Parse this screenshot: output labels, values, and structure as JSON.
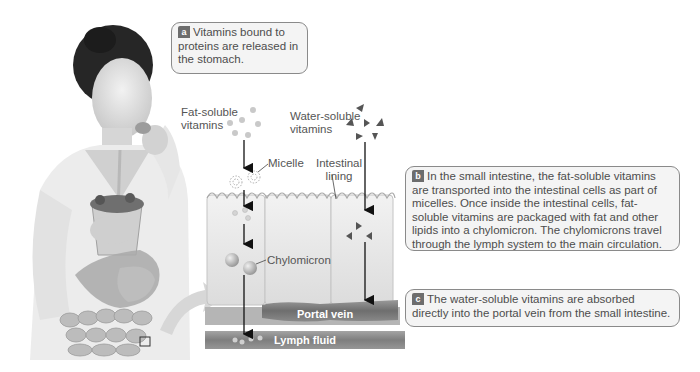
{
  "figure": {
    "domain": "Diagram",
    "palette": {
      "background": "#ffffff",
      "callout_fill": "#f4f4f4",
      "callout_border": "#8a8a8a",
      "badge_fill": "#6d6d6d",
      "vessel_fill": "#7a7a7a",
      "cell_fill": "#e4e4e4",
      "text": "#4d4d4d"
    }
  },
  "callouts": {
    "a": {
      "badge": "a",
      "text": "Vitamins bound to proteins are released in the stomach."
    },
    "b": {
      "badge": "b",
      "text": "In the small intestine, the fat-soluble vitamins are transported into the intestinal cells as part of micelles. Once inside the intestinal cells, fat-soluble vitamins are packaged with fat and other lipids into a chylomicron. The chylomicrons travel through the lymph system to the main circulation."
    },
    "c": {
      "badge": "c",
      "text": "The water-soluble vitamins are absorbed directly into the portal vein from the small intestine."
    }
  },
  "labels": {
    "fat_soluble_line1": "Fat-soluble",
    "fat_soluble_line2": "vitamins",
    "water_soluble_line1": "Water-soluble",
    "water_soluble_line2": "vitamins",
    "micelle": "Micelle",
    "intestinal_line1": "Intestinal",
    "intestinal_line2": "lining",
    "chylomicron": "Chylomicron",
    "portal_vein": "Portal vein",
    "lymph_fluid": "Lymph fluid"
  },
  "illustration": {
    "person": "woman drinking from a glass with a straw",
    "overlay": "digestive tract (stomach and small intestine)",
    "zoom_box": "small square on intestine indicating magnified region"
  }
}
